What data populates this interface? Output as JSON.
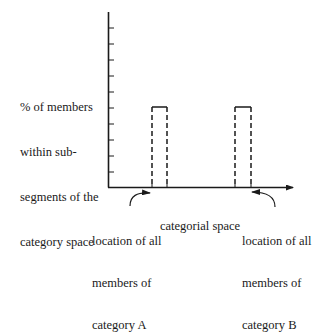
{
  "diagram": {
    "y_axis_label": [
      "% of members",
      "within sub-",
      "segments of the",
      "category space"
    ],
    "x_axis_label": "categorial space",
    "annotations": {
      "a": [
        "location of all",
        "members of",
        "category A"
      ],
      "b": [
        "location of all",
        "members of",
        "category B"
      ]
    },
    "y_ticks": 10,
    "bars": [
      {
        "name": "category A",
        "left": 152,
        "right": 167,
        "top": 107,
        "style": "dashed"
      },
      {
        "name": "category B",
        "left": 235,
        "right": 251,
        "top": 107,
        "style": "dashed"
      }
    ],
    "colors": {
      "ink": "#1a1a1a",
      "background": "#ffffff"
    }
  }
}
